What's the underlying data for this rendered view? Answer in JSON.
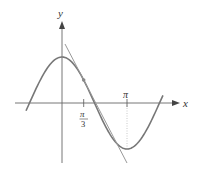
{
  "diagram": {
    "function": "cos",
    "tangent_at": "π/3",
    "axes": {
      "x_label": "x",
      "y_label": "y"
    },
    "ticks": [
      {
        "id": "pi-over-3",
        "numerator": "π",
        "denominator": "3"
      },
      {
        "id": "pi",
        "label": "π"
      }
    ],
    "colors": {
      "curve": "#777777",
      "tangent": "#999999",
      "axes": "#666666",
      "point": "#888888",
      "dotted_guide": "#bbbbbb",
      "text": "#333333"
    },
    "geometry": {
      "origin_px": [
        62,
        103
      ],
      "px_per_pi": 65,
      "amplitude_px": 46,
      "x_range_rad": [
        -1.74,
        4.88
      ]
    }
  }
}
